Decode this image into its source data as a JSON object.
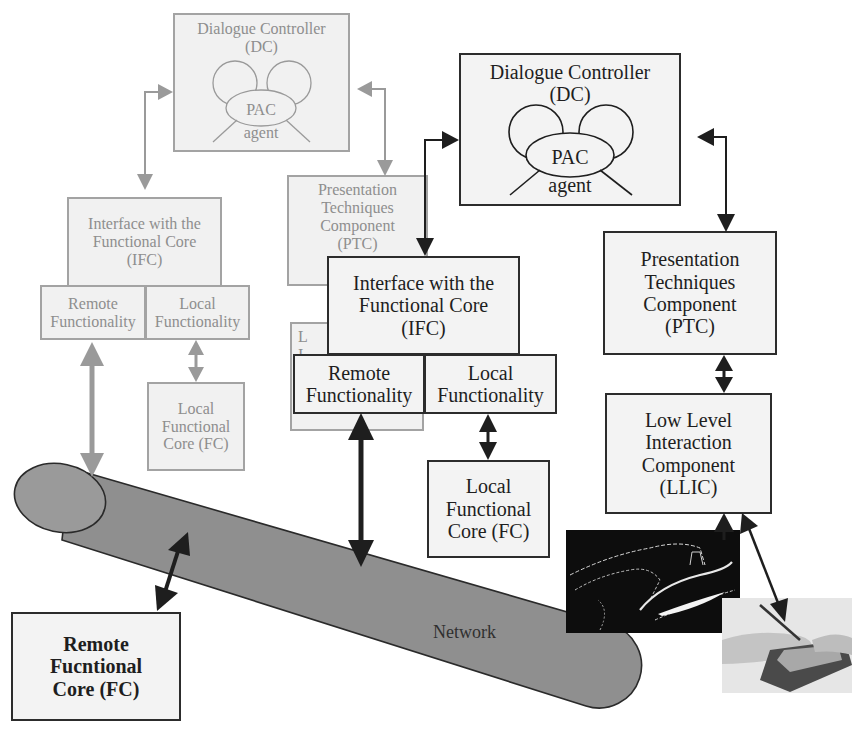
{
  "colors": {
    "grey_stroke": "#a3a3a3",
    "grey_fill": "#f1f1f1",
    "grey_text": "#8e8e8e",
    "black_stroke": "#2c2c2c",
    "black_fill": "#f3f3f3",
    "network_fill": "#8f8f8f",
    "network_cap_fill": "#9a9a9a"
  },
  "faded_client": {
    "dc": {
      "line1": "Dialogue Controller",
      "line2": "(DC)",
      "pac": "PAC",
      "agent": "agent"
    },
    "ifc": {
      "line1": "Interface with the",
      "line2": "Functional Core",
      "line3": "(IFC)"
    },
    "remote_functionality": {
      "line1": "Remote",
      "line2": "Functionality"
    },
    "local_functionality": {
      "line1": "Local",
      "line2": "Functionality"
    },
    "local_fc": {
      "line1": "Local",
      "line2": "Functional",
      "line3": "Core (FC)"
    },
    "ptc": {
      "line1": "Presentation",
      "line2": "Techniques",
      "line3": "Component",
      "line4": "(PTC)"
    },
    "llic_partial": {
      "line1": "L",
      "line2": "I"
    }
  },
  "client": {
    "dc": {
      "line1": "Dialogue Controller",
      "line2": "(DC)",
      "pac": "PAC",
      "agent": "agent"
    },
    "ifc": {
      "line1": "Interface with the",
      "line2": "Functional Core",
      "line3": "(IFC)"
    },
    "remote_functionality": {
      "line1": "Remote",
      "line2": "Functionality"
    },
    "local_functionality": {
      "line1": "Local",
      "line2": "Functionality"
    },
    "local_fc": {
      "line1": "Local",
      "line2": "Functional",
      "line3": "Core (FC)"
    },
    "ptc": {
      "line1": "Presentation",
      "line2": "Techniques",
      "line3": "Component",
      "line4": "(PTC)"
    },
    "llic": {
      "line1": "Low Level",
      "line2": "Interaction",
      "line3": "Component",
      "line4": "(LLIC)"
    }
  },
  "server": {
    "remote_fc": {
      "line1": "Remote",
      "line2": "Fucntional",
      "line3": "Core (FC)"
    }
  },
  "network": {
    "label": "Network"
  },
  "images": [
    {
      "name": "gesture-screenshot",
      "description": "dark screen with traced white strokes"
    },
    {
      "name": "pen-tablet-photo",
      "description": "hand holding stylus over handheld device"
    }
  ]
}
